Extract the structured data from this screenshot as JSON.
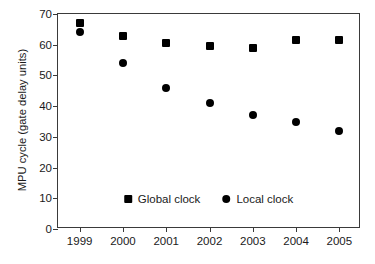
{
  "chart_data": {
    "type": "scatter",
    "title": "",
    "xlabel": "",
    "ylabel": "MPU cycle (gate delay units)",
    "categories": [
      "1999",
      "2000",
      "2001",
      "2002",
      "2003",
      "2004",
      "2005"
    ],
    "x": [
      1999,
      2000,
      2001,
      2002,
      2003,
      2004,
      2005
    ],
    "xlim": [
      1998.5,
      2005.5
    ],
    "ylim": [
      0,
      70
    ],
    "yticks": [
      0,
      10,
      20,
      30,
      40,
      50,
      60,
      70
    ],
    "ytick_labels": [
      "0",
      "10",
      "20",
      "30",
      "40",
      "50",
      "60",
      "70"
    ],
    "xtick_labels": [
      "1999",
      "2000",
      "2001",
      "2002",
      "2003",
      "2004",
      "2005"
    ],
    "grid": false,
    "legend_position": "lower center inside axes",
    "series": [
      {
        "name": "Global clock",
        "marker": "square",
        "color": "#000000",
        "values": [
          67,
          63,
          60.5,
          59.5,
          59,
          61.5,
          61.5
        ]
      },
      {
        "name": "Local clock",
        "marker": "circle",
        "color": "#000000",
        "values": [
          64,
          54,
          46,
          41,
          37,
          35,
          32
        ]
      }
    ]
  },
  "legend": {
    "entries": [
      {
        "label": "Global clock",
        "marker": "square"
      },
      {
        "label": "Local clock",
        "marker": "circle"
      }
    ]
  },
  "colors": {
    "marker": "#000000",
    "axis": "#3a3a3a",
    "text": "#1a1a1a",
    "background": "#ffffff"
  }
}
